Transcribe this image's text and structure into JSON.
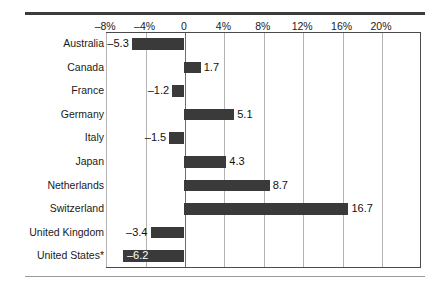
{
  "chart_data": {
    "type": "bar",
    "orientation": "horizontal",
    "title": "",
    "subtitle": "",
    "xlabel": "",
    "ylabel": "",
    "grid": true,
    "legend": null,
    "xlim": [
      -10,
      22
    ],
    "axis_tick_labels": [
      "–8%",
      "–4%",
      "0",
      "4%",
      "8%",
      "12%",
      "16%",
      "20%"
    ],
    "axis_tick_values": [
      -8,
      -4,
      0,
      4,
      8,
      12,
      16,
      20
    ],
    "categories": [
      "Australia",
      "Canada",
      "France",
      "Germany",
      "Italy",
      "Japan",
      "Netherlands",
      "Switzerland",
      "United Kingdom",
      "United States*"
    ],
    "values": [
      -5.3,
      1.7,
      -1.2,
      5.1,
      -1.5,
      4.3,
      8.7,
      16.7,
      -3.4,
      -6.2
    ],
    "value_labels": [
      "–5.3",
      "1.7",
      "–1.2",
      "5.1",
      "–1.5",
      "4.3",
      "8.7",
      "16.7",
      "–3.4",
      "–6.2"
    ],
    "bar_color": "#3a3a3a",
    "gridline_color": "#b4b4b4",
    "frame_color": "#4a4a4a",
    "background_color": "#ffffff",
    "label_placement": [
      "outside-left",
      "outside-right",
      "outside-left",
      "outside-right",
      "outside-left",
      "outside-right",
      "outside-right",
      "outside-right",
      "outside-left",
      "inside-right"
    ]
  },
  "rules": {
    "top": "thick-horizontal-rule",
    "bottom": "thin-horizontal-rule"
  }
}
